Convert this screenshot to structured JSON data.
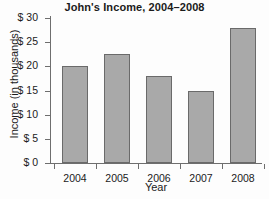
{
  "chart_data": {
    "type": "bar",
    "title": "John's Income, 2004–2008",
    "xlabel": "Year",
    "ylabel": "Income (in thousands)",
    "categories": [
      "2004",
      "2005",
      "2006",
      "2007",
      "2008"
    ],
    "values": [
      20,
      22.5,
      18,
      15,
      28
    ],
    "ylim": [
      0,
      30
    ],
    "ytick_values": [
      0,
      5,
      10,
      15,
      20,
      25,
      30
    ],
    "ytick_labels": [
      "$ 0",
      "$ 5",
      "$ 10",
      "$ 15",
      "$ 20",
      "$ 25",
      "$ 30"
    ],
    "grid": false,
    "legend": null,
    "bar_color": "#a9a9a9",
    "bar_border_color": "#6a6a6a",
    "axis_color": "#6e6e6e",
    "text_color": "#1b1b1b",
    "background": "#fdfdfd"
  }
}
